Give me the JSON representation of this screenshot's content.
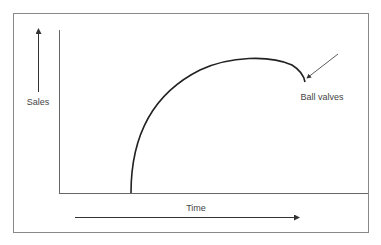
{
  "diagram": {
    "type": "product-life-cycle-curve",
    "y_axis_label": "Sales",
    "x_axis_label": "Time",
    "annotation": "Ball valves",
    "curve_description": "Sales rise steeply from zero, flatten into a broad peak, then dip downward at the end (annotated point)",
    "colors": {
      "line": "#222222",
      "axis": "#666666",
      "text": "#444444",
      "border": "#888888"
    }
  }
}
